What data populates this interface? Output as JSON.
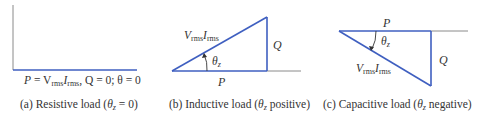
{
  "panels": [
    {
      "id": "a",
      "caption": "(a) Resistive load (θz = 0)",
      "caption_parts": {
        "pre": "(a) Resistive load (",
        "theta": "θ",
        "sub": "z",
        "post": " = 0)"
      },
      "equation": {
        "P": "P",
        "eq1": " = V",
        "rms1": "rms",
        "I": "I",
        "rms2": "rms",
        "rest": ", Q = 0; θ = 0"
      }
    },
    {
      "id": "b",
      "caption_parts": {
        "pre": "(b) Inductive load (",
        "theta": "θ",
        "sub": "z",
        "post": " positive)"
      },
      "labels": {
        "hyp_V": "V",
        "hyp_rms1": "rms",
        "hyp_I": "I",
        "hyp_rms2": "rms",
        "Q": "Q",
        "P": "P",
        "theta": "θ",
        "theta_sub": "z"
      }
    },
    {
      "id": "c",
      "caption_parts": {
        "pre": "(c) Capacitive load (",
        "theta": "θ",
        "sub": "z",
        "post": " negative)"
      },
      "labels": {
        "hyp_V": "V",
        "hyp_rms1": "rms",
        "hyp_I": "I",
        "hyp_rms2": "rms",
        "Q": "Q",
        "P": "P",
        "theta": "θ",
        "theta_sub": "z"
      }
    }
  ],
  "colors": {
    "vector": "#3f5fc0",
    "axis": "#888888",
    "text": "#333333"
  }
}
